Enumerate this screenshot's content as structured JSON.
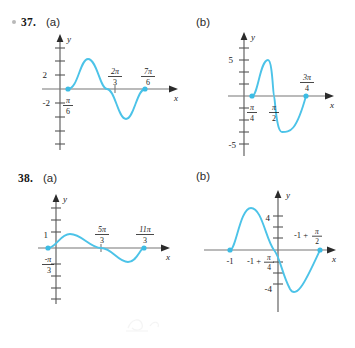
{
  "page": {
    "background": "#ffffff",
    "curve_color": "#4cc3e8",
    "axis_color": "#555555",
    "text_color": "#1a1a1a"
  },
  "problems": [
    {
      "number": "37.",
      "has_bullet_icon": true,
      "bullet_icon": "bullet-dot-icon",
      "parts": [
        {
          "label": "(a)",
          "graph": {
            "axis_x_label": "x",
            "axis_y_label": "y",
            "y_ticks": [
              "2",
              "-2"
            ],
            "x_labels": [
              "π⁄6",
              "2π⁄3",
              "7π⁄6"
            ],
            "x_label_numerators": [
              "π",
              "2π",
              "7π"
            ],
            "x_label_denominators": [
              "6",
              "3",
              "6"
            ],
            "marked_points": [
              "π/6",
              "7π/6"
            ],
            "amplitude": 2,
            "curve_shape": "sine-one-period"
          }
        },
        {
          "label": "(b)",
          "graph": {
            "axis_x_label": "x",
            "axis_y_label": "y",
            "y_ticks": [
              "5",
              "-5"
            ],
            "x_labels": [
              "π⁄4",
              "π⁄2",
              "3π⁄4"
            ],
            "x_label_numerators": [
              "π",
              "π",
              "3π"
            ],
            "x_label_denominators": [
              "4",
              "2",
              "4"
            ],
            "marked_points": [
              "π/4",
              "3π/4"
            ],
            "amplitude": 5,
            "curve_shape": "sine-one-period"
          }
        }
      ]
    },
    {
      "number": "38.",
      "has_bullet_icon": false,
      "bullet_icon": "",
      "parts": [
        {
          "label": "(a)",
          "graph": {
            "axis_x_label": "x",
            "axis_y_label": "y",
            "y_ticks": [
              "1"
            ],
            "x_labels": [
              "-π⁄3",
              "5π⁄3",
              "11π⁄3"
            ],
            "x_label_numerators": [
              "-π",
              "5π",
              "11π"
            ],
            "x_label_denominators": [
              "3",
              "3",
              "3"
            ],
            "marked_points": [
              "-π/3",
              "11π/3"
            ],
            "amplitude": 1,
            "curve_shape": "sine-one-period"
          }
        },
        {
          "label": "(b)",
          "graph": {
            "axis_x_label": "x",
            "axis_y_label": "y",
            "y_ticks": [
              "4",
              "-4"
            ],
            "x_labels": [
              "-1",
              "-1 + π⁄4",
              "-1 + π⁄2"
            ],
            "x_label_plain": [
              "-1"
            ],
            "x_label_compound_prefix": [
              "-1 +",
              "-1 +"
            ],
            "x_label_numerators": [
              "π",
              "π"
            ],
            "x_label_denominators": [
              "4",
              "2"
            ],
            "marked_points": [
              "-1",
              "-1 + π/2"
            ],
            "amplitude": 4,
            "curve_shape": "sine-one-period"
          }
        }
      ]
    }
  ]
}
